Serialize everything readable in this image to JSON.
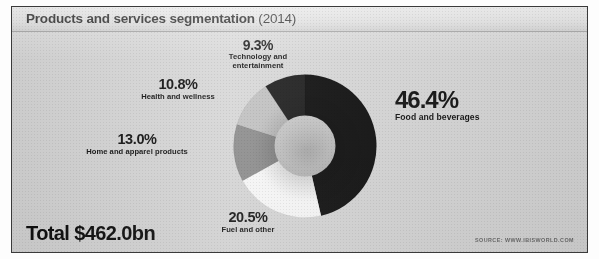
{
  "title": {
    "main": "Products and services segmentation",
    "year": "(2014)"
  },
  "footer": {
    "total": "Total $462.0bn",
    "source": "SOURCE: WWW.IBISWORLD.COM"
  },
  "labels": {
    "food": {
      "pct": "46.4%",
      "desc": "Food and beverages"
    },
    "fuel": {
      "pct": "20.5%",
      "desc": "Fuel and other"
    },
    "home": {
      "pct": "13.0%",
      "desc": "Home and apparel products"
    },
    "health": {
      "pct": "10.8%",
      "desc": "Health and wellness"
    },
    "tech": {
      "pct": "9.3%",
      "desc_line1": "Technology and",
      "desc_line2": "entertainment"
    }
  },
  "chart_data": {
    "type": "pie",
    "variant": "donut",
    "title": "Products and services segmentation (2014)",
    "total_label": "Total $462.0bn",
    "total_value": 462.0,
    "total_units": "bn USD",
    "units": "percent",
    "start_angle_deg": 0,
    "direction": "clockwise",
    "inner_radius_ratio": 0.42,
    "legend": "none",
    "grid": false,
    "categories": [
      "Food and beverages",
      "Fuel and other",
      "Home and apparel products",
      "Health and wellness",
      "Technology and entertainment"
    ],
    "values": [
      46.4,
      20.5,
      13.0,
      10.8,
      9.3
    ],
    "colors": [
      "#0d0d0d",
      "#fbfbfb",
      "#8d8d8d",
      "#c2c2c2",
      "#1c1c1c"
    ],
    "slices": [
      {
        "label": "Food and beverages",
        "value": 46.4,
        "color": "#0d0d0d"
      },
      {
        "label": "Fuel and other",
        "value": 20.5,
        "color": "#fbfbfb"
      },
      {
        "label": "Home and apparel products",
        "value": 13.0,
        "color": "#8d8d8d"
      },
      {
        "label": "Health and wellness",
        "value": 10.8,
        "color": "#c2c2c2"
      },
      {
        "label": "Technology and entertainment",
        "value": 9.3,
        "color": "#1c1c1c"
      }
    ],
    "xlabel": "",
    "ylabel": ""
  }
}
